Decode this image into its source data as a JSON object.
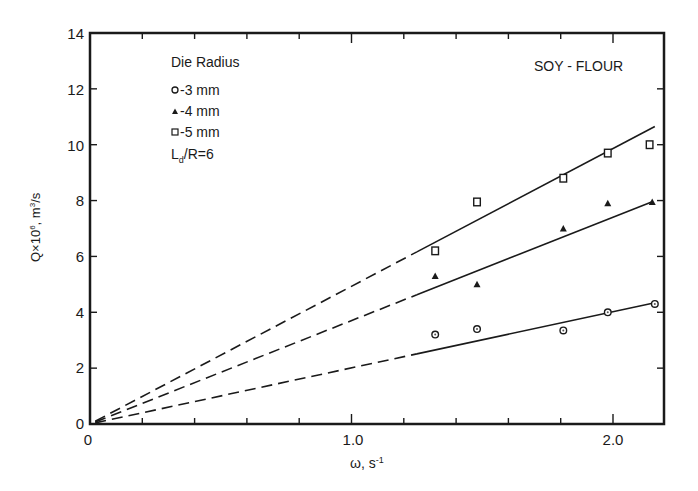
{
  "chart_data": {
    "type": "scatter",
    "title": "SOY - FLOUR",
    "xlabel": "ω, s⁻¹",
    "ylabel": "Q×10⁶, m³/s",
    "xlim": [
      0,
      2.2
    ],
    "ylim": [
      0,
      14
    ],
    "x_ticks": [
      0,
      0.2,
      0.4,
      0.6,
      0.8,
      1.0,
      1.2,
      1.4,
      1.6,
      1.8,
      2.0
    ],
    "x_tick_labels": {
      "0": "0",
      "1.0": "1.0",
      "2.0": "2.0"
    },
    "y_ticks": [
      0,
      2,
      4,
      6,
      8,
      10,
      12,
      14
    ],
    "y_tick_labels": [
      "0",
      "2",
      "4",
      "6",
      "8",
      "10",
      "12",
      "14"
    ],
    "grid": false,
    "legend": {
      "title": "Die Radius",
      "position": "upper-left",
      "entries": [
        "-3 mm",
        "-4 mm",
        "-5 mm"
      ],
      "note": "L_d/R=6"
    },
    "series": [
      {
        "name": "3 mm",
        "marker": "circle",
        "x": [
          1.32,
          1.48,
          1.81,
          1.98,
          2.16
        ],
        "y": [
          3.2,
          3.4,
          3.35,
          4.0,
          4.3
        ],
        "fit_line": {
          "x0": 0,
          "y0": 0,
          "x1": 2.16,
          "y1": 4.34,
          "dashed_until_x": 1.25
        }
      },
      {
        "name": "4 mm",
        "marker": "triangle",
        "x": [
          1.32,
          1.48,
          1.81,
          1.98,
          2.15
        ],
        "y": [
          5.3,
          5.0,
          7.0,
          7.9,
          7.95
        ],
        "fit_line": {
          "x0": 0,
          "y0": 0,
          "x1": 2.15,
          "y1": 7.96,
          "dashed_until_x": 1.25
        }
      },
      {
        "name": "5 mm",
        "marker": "square",
        "x": [
          1.32,
          1.48,
          1.81,
          1.98,
          2.14
        ],
        "y": [
          6.2,
          7.95,
          8.8,
          9.7,
          10.0
        ],
        "fit_line": {
          "x0": 0,
          "y0": 0,
          "x1": 2.16,
          "y1": 10.65,
          "dashed_until_x": 1.25
        }
      }
    ]
  },
  "labels": {
    "title": "SOY - FLOUR",
    "legend_title": "Die Radius",
    "legend_3mm": "-3 mm",
    "legend_4mm": "-4 mm",
    "legend_5mm": "-5 mm",
    "legend_ld": "L",
    "legend_ld_sub": "d",
    "legend_ld_rest": "/R=6",
    "xlabel_omega": "ω",
    "xlabel_rest": ", s",
    "xlabel_sup": "-1",
    "ylabel_q": "Q×10",
    "ylabel_sup6": "6",
    "ylabel_m": ", m",
    "ylabel_sup3": "3",
    "ylabel_s": "/s",
    "x0": "0",
    "x1": "1.0",
    "x2": "2.0",
    "y0": "0",
    "y2": "2",
    "y4": "4",
    "y6": "6",
    "y8": "8",
    "y10": "10",
    "y12": "12",
    "y14": "14"
  }
}
